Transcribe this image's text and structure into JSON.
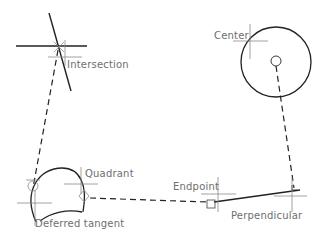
{
  "diagram": {
    "labels": {
      "intersection": "Intersection",
      "center": "Center",
      "quadrant": "Quadrant",
      "endpoint": "Endpoint",
      "perpendicular": "Perpendicular",
      "deferred_tangent": "Deferred tangent"
    },
    "colors": {
      "geometry": "#222222",
      "crosshair": "#8a8a8a",
      "label": "#6e6e6e"
    }
  }
}
